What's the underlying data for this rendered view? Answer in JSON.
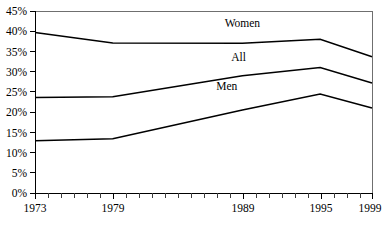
{
  "chart_data": {
    "type": "line",
    "title": "",
    "subtitle": "",
    "xlabel": "",
    "ylabel": "",
    "x": [
      1973,
      1979,
      1989,
      1995,
      1999
    ],
    "xlim": [
      1973,
      1999
    ],
    "ylim": [
      0,
      45
    ],
    "grid": false,
    "legend_position": "inline-labels",
    "y_tick_labels": [
      "0%",
      "5%",
      "10%",
      "15%",
      "20%",
      "25%",
      "30%",
      "35%",
      "40%",
      "45%"
    ],
    "y_tick_values": [
      0,
      5,
      10,
      15,
      20,
      25,
      30,
      35,
      40,
      45
    ],
    "x_tick_labels": [
      "1973",
      "1979",
      "1989",
      "1995",
      "1999"
    ],
    "x_tick_values": [
      1973,
      1979,
      1989,
      1995,
      1999
    ],
    "x_minor_tick_values": [
      1974,
      1975,
      1976,
      1977,
      1978,
      1980,
      1981,
      1982,
      1983,
      1984,
      1985,
      1986,
      1987,
      1988,
      1990,
      1991,
      1992,
      1993,
      1994,
      1996,
      1997,
      1998
    ],
    "series": [
      {
        "name": "Women",
        "values": [
          39.7,
          37.1,
          37.0,
          38.0,
          33.7
        ],
        "label": "Women",
        "label_x": 1989.0,
        "label_y": 41.0,
        "color": "#000000"
      },
      {
        "name": "All",
        "values": [
          23.6,
          23.8,
          29.0,
          31.0,
          27.2
        ],
        "label": "All",
        "label_x": 1988.7,
        "label_y": 32.7,
        "color": "#000000"
      },
      {
        "name": "Men",
        "values": [
          12.9,
          13.4,
          20.5,
          24.5,
          21.0
        ],
        "label": "Men",
        "label_x": 1987.8,
        "label_y": 25.5,
        "color": "#000000"
      }
    ],
    "annotations": []
  },
  "axes": {
    "y_axis_name": "percent-axis",
    "x_axis_name": "year-axis"
  }
}
